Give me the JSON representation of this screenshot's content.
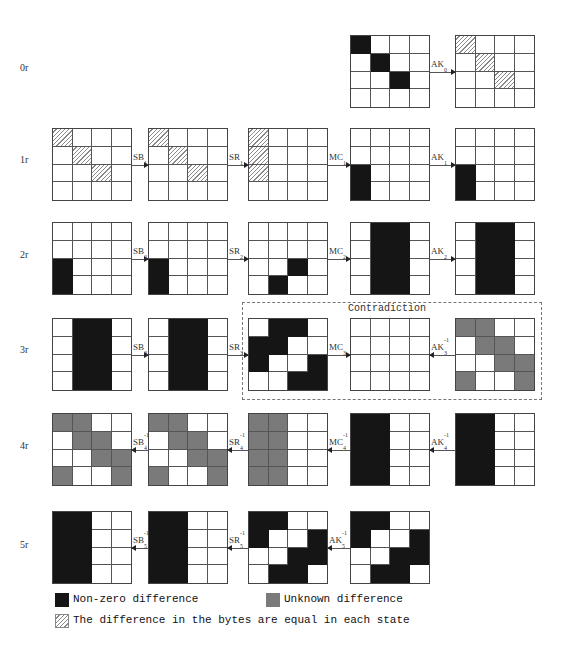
{
  "colors": {
    "nonzero": "#151515",
    "unknown": "#7a7a7a",
    "hatch": "#8a8a8a",
    "empty": "#ffffff"
  },
  "rounds": [
    {
      "label": "0r",
      "y": 35,
      "label_y": 68,
      "grids": [
        {
          "x": 350,
          "cells": [
            [
              "B",
              0,
              0,
              0
            ],
            [
              0,
              "B",
              0,
              0
            ],
            [
              0,
              0,
              "B",
              0
            ],
            [
              0,
              0,
              0,
              0
            ]
          ]
        },
        {
          "x": 455,
          "cells": [
            [
              "H",
              0,
              0,
              0
            ],
            [
              0,
              "H",
              0,
              0
            ],
            [
              0,
              0,
              "H",
              0
            ],
            [
              0,
              0,
              0,
              0
            ]
          ]
        }
      ],
      "ops": [
        {
          "base": "AK",
          "sub": "0",
          "sup": "",
          "dir": "right",
          "x1": 430,
          "x2": 455
        }
      ]
    },
    {
      "label": "1r",
      "y": 128,
      "label_y": 160,
      "grids": [
        {
          "x": 52,
          "cells": [
            [
              "H",
              0,
              0,
              0
            ],
            [
              0,
              "H",
              0,
              0
            ],
            [
              0,
              0,
              "H",
              0
            ],
            [
              0,
              0,
              0,
              0
            ]
          ]
        },
        {
          "x": 148,
          "cells": [
            [
              "H",
              0,
              0,
              0
            ],
            [
              0,
              "H",
              0,
              0
            ],
            [
              0,
              0,
              "H",
              0
            ],
            [
              0,
              0,
              0,
              0
            ]
          ]
        },
        {
          "x": 248,
          "cells": [
            [
              "H",
              0,
              0,
              0
            ],
            [
              "H",
              0,
              0,
              0
            ],
            [
              "H",
              0,
              0,
              0
            ],
            [
              0,
              0,
              0,
              0
            ]
          ]
        },
        {
          "x": 350,
          "cells": [
            [
              0,
              0,
              0,
              0
            ],
            [
              0,
              0,
              0,
              0
            ],
            [
              "B",
              0,
              0,
              0
            ],
            [
              "B",
              0,
              0,
              0
            ]
          ]
        },
        {
          "x": 455,
          "cells": [
            [
              0,
              0,
              0,
              0
            ],
            [
              0,
              0,
              0,
              0
            ],
            [
              "B",
              0,
              0,
              0
            ],
            [
              "B",
              0,
              0,
              0
            ]
          ]
        }
      ],
      "ops": [
        {
          "base": "SB",
          "sub": "1",
          "sup": "",
          "dir": "right",
          "x1": 132,
          "x2": 148
        },
        {
          "base": "SR",
          "sub": "1",
          "sup": "",
          "dir": "right",
          "x1": 228,
          "x2": 248
        },
        {
          "base": "MC",
          "sub": "1",
          "sup": "",
          "dir": "right",
          "x1": 328,
          "x2": 350
        },
        {
          "base": "AK",
          "sub": "1",
          "sup": "",
          "dir": "right",
          "x1": 430,
          "x2": 455
        }
      ]
    },
    {
      "label": "2r",
      "y": 222,
      "label_y": 255,
      "grids": [
        {
          "x": 52,
          "cells": [
            [
              0,
              0,
              0,
              0
            ],
            [
              0,
              0,
              0,
              0
            ],
            [
              "B",
              0,
              0,
              0
            ],
            [
              "B",
              0,
              0,
              0
            ]
          ]
        },
        {
          "x": 148,
          "cells": [
            [
              0,
              0,
              0,
              0
            ],
            [
              0,
              0,
              0,
              0
            ],
            [
              "B",
              0,
              0,
              0
            ],
            [
              "B",
              0,
              0,
              0
            ]
          ]
        },
        {
          "x": 248,
          "cells": [
            [
              0,
              0,
              0,
              0
            ],
            [
              0,
              0,
              0,
              0
            ],
            [
              0,
              0,
              "B",
              0
            ],
            [
              0,
              "B",
              0,
              0
            ]
          ]
        },
        {
          "x": 350,
          "cells": [
            [
              0,
              "B",
              "B",
              0
            ],
            [
              0,
              "B",
              "B",
              0
            ],
            [
              0,
              "B",
              "B",
              0
            ],
            [
              0,
              "B",
              "B",
              0
            ]
          ]
        },
        {
          "x": 455,
          "cells": [
            [
              0,
              "B",
              "B",
              0
            ],
            [
              0,
              "B",
              "B",
              0
            ],
            [
              0,
              "B",
              "B",
              0
            ],
            [
              0,
              "B",
              "B",
              0
            ]
          ]
        }
      ],
      "ops": [
        {
          "base": "SB",
          "sub": "2",
          "sup": "",
          "dir": "right",
          "x1": 132,
          "x2": 148
        },
        {
          "base": "SR",
          "sub": "2",
          "sup": "",
          "dir": "right",
          "x1": 228,
          "x2": 248
        },
        {
          "base": "MC",
          "sub": "2",
          "sup": "",
          "dir": "right",
          "x1": 328,
          "x2": 350
        },
        {
          "base": "AK",
          "sub": "2",
          "sup": "",
          "dir": "right",
          "x1": 430,
          "x2": 455
        }
      ]
    },
    {
      "label": "3r",
      "y": 318,
      "label_y": 350,
      "grids": [
        {
          "x": 52,
          "cells": [
            [
              0,
              "B",
              "B",
              0
            ],
            [
              0,
              "B",
              "B",
              0
            ],
            [
              0,
              "B",
              "B",
              0
            ],
            [
              0,
              "B",
              "B",
              0
            ]
          ]
        },
        {
          "x": 148,
          "cells": [
            [
              0,
              "B",
              "B",
              0
            ],
            [
              0,
              "B",
              "B",
              0
            ],
            [
              0,
              "B",
              "B",
              0
            ],
            [
              0,
              "B",
              "B",
              0
            ]
          ]
        },
        {
          "x": 248,
          "cells": [
            [
              0,
              "B",
              "B",
              0
            ],
            [
              "B",
              "B",
              0,
              0
            ],
            [
              "B",
              0,
              0,
              "B"
            ],
            [
              0,
              0,
              "B",
              "B"
            ]
          ]
        },
        {
          "x": 350,
          "cells": [
            [
              0,
              0,
              0,
              0
            ],
            [
              0,
              0,
              0,
              0
            ],
            [
              0,
              0,
              0,
              0
            ],
            [
              0,
              0,
              0,
              0
            ]
          ]
        },
        {
          "x": 455,
          "cells": [
            [
              "G",
              "G",
              0,
              0
            ],
            [
              0,
              "G",
              "G",
              0
            ],
            [
              0,
              0,
              "G",
              "G"
            ],
            [
              "G",
              0,
              0,
              "G"
            ]
          ]
        }
      ],
      "ops": [
        {
          "base": "SB",
          "sub": "3",
          "sup": "",
          "dir": "right",
          "x1": 132,
          "x2": 148
        },
        {
          "base": "SR",
          "sub": "3",
          "sup": "",
          "dir": "right",
          "x1": 228,
          "x2": 248
        },
        {
          "base": "MC",
          "sub": "3",
          "sup": "",
          "dir": "right",
          "x1": 328,
          "x2": 350
        },
        {
          "base": "AK",
          "sub": "3",
          "sup": "-1",
          "dir": "left",
          "x1": 430,
          "x2": 455
        }
      ],
      "contradiction_label": "Contradiction"
    },
    {
      "label": "4r",
      "y": 413,
      "label_y": 446,
      "grids": [
        {
          "x": 52,
          "cells": [
            [
              "G",
              "G",
              0,
              0
            ],
            [
              0,
              "G",
              "G",
              0
            ],
            [
              0,
              0,
              "G",
              "G"
            ],
            [
              "G",
              0,
              0,
              "G"
            ]
          ]
        },
        {
          "x": 148,
          "cells": [
            [
              "G",
              "G",
              0,
              0
            ],
            [
              0,
              "G",
              "G",
              0
            ],
            [
              0,
              0,
              "G",
              "G"
            ],
            [
              "G",
              0,
              0,
              "G"
            ]
          ]
        },
        {
          "x": 248,
          "cells": [
            [
              "G",
              "G",
              0,
              0
            ],
            [
              "G",
              "G",
              0,
              0
            ],
            [
              "G",
              "G",
              0,
              0
            ],
            [
              "G",
              "G",
              0,
              0
            ]
          ]
        },
        {
          "x": 350,
          "cells": [
            [
              "B",
              "B",
              0,
              0
            ],
            [
              "B",
              "B",
              0,
              0
            ],
            [
              "B",
              "B",
              0,
              0
            ],
            [
              "B",
              "B",
              0,
              0
            ]
          ]
        },
        {
          "x": 455,
          "cells": [
            [
              "B",
              "B",
              0,
              0
            ],
            [
              "B",
              "B",
              0,
              0
            ],
            [
              "B",
              "B",
              0,
              0
            ],
            [
              "B",
              "B",
              0,
              0
            ]
          ]
        }
      ],
      "ops": [
        {
          "base": "SB",
          "sub": "4",
          "sup": "-1",
          "dir": "left",
          "x1": 132,
          "x2": 148
        },
        {
          "base": "SR",
          "sub": "4",
          "sup": "-1",
          "dir": "left",
          "x1": 228,
          "x2": 248
        },
        {
          "base": "MC",
          "sub": "4",
          "sup": "-1",
          "dir": "left",
          "x1": 328,
          "x2": 350
        },
        {
          "base": "AK",
          "sub": "4",
          "sup": "-1",
          "dir": "left",
          "x1": 430,
          "x2": 455
        }
      ]
    },
    {
      "label": "5r",
      "y": 511,
      "label_y": 545,
      "grids": [
        {
          "x": 52,
          "cells": [
            [
              "B",
              "B",
              0,
              0
            ],
            [
              "B",
              "B",
              0,
              0
            ],
            [
              "B",
              "B",
              0,
              0
            ],
            [
              "B",
              "B",
              0,
              0
            ]
          ]
        },
        {
          "x": 148,
          "cells": [
            [
              "B",
              "B",
              0,
              0
            ],
            [
              "B",
              "B",
              0,
              0
            ],
            [
              "B",
              "B",
              0,
              0
            ],
            [
              "B",
              "B",
              0,
              0
            ]
          ]
        },
        {
          "x": 248,
          "cells": [
            [
              "B",
              "B",
              0,
              0
            ],
            [
              "B",
              0,
              0,
              "B"
            ],
            [
              0,
              0,
              "B",
              "B"
            ],
            [
              0,
              "B",
              "B",
              0
            ]
          ]
        },
        {
          "x": 350,
          "cells": [
            [
              "B",
              "B",
              0,
              0
            ],
            [
              "B",
              0,
              0,
              "B"
            ],
            [
              0,
              0,
              "B",
              "B"
            ],
            [
              0,
              "B",
              "B",
              0
            ]
          ]
        }
      ],
      "ops": [
        {
          "base": "SB",
          "sub": "5",
          "sup": "-1",
          "dir": "left",
          "x1": 132,
          "x2": 148
        },
        {
          "base": "SR",
          "sub": "5",
          "sup": "-1",
          "dir": "left",
          "x1": 228,
          "x2": 248
        },
        {
          "base": "AK",
          "sub": "5",
          "sup": "-1",
          "dir": "left",
          "x1": 328,
          "x2": 350
        }
      ]
    }
  ],
  "legend": {
    "nonzero": "Non-zero difference",
    "unknown": "Unknown difference",
    "hatched": "The difference in the bytes are equal in each state"
  }
}
